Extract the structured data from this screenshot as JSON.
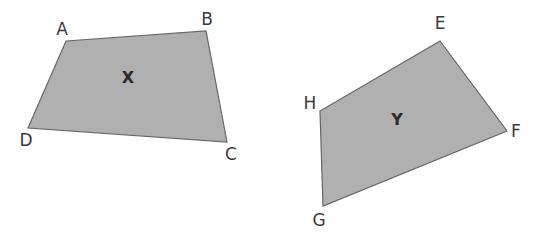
{
  "diagram": {
    "colors": {
      "background": "#ffffff",
      "fill": "#b0b0b0",
      "stroke": "#666666",
      "text": "#3a3a3a"
    },
    "shapes": [
      {
        "name": "X",
        "label": "X",
        "label_pos": [
          128,
          83
        ],
        "vertices": [
          {
            "name": "A",
            "label": "A",
            "point": [
              66,
              41
            ],
            "label_pos": [
              62,
              35
            ]
          },
          {
            "name": "B",
            "label": "B",
            "point": [
              206,
              31
            ],
            "label_pos": [
              207,
              25
            ]
          },
          {
            "name": "C",
            "label": "C",
            "point": [
              227,
              142
            ],
            "label_pos": [
              231,
              160
            ]
          },
          {
            "name": "D",
            "label": "D",
            "point": [
              28,
              128
            ],
            "label_pos": [
              26,
              146
            ]
          }
        ]
      },
      {
        "name": "Y",
        "label": "Y",
        "label_pos": [
          397,
          125
        ],
        "vertices": [
          {
            "name": "E",
            "label": "E",
            "point": [
              440,
              41
            ],
            "label_pos": [
              440,
              29
            ]
          },
          {
            "name": "F",
            "label": "F",
            "point": [
              507,
              131
            ],
            "label_pos": [
              516,
              137
            ]
          },
          {
            "name": "G",
            "label": "G",
            "point": [
              323,
              206
            ],
            "label_pos": [
              319,
              226
            ]
          },
          {
            "name": "H",
            "label": "H",
            "point": [
              320,
              111
            ],
            "label_pos": [
              310,
              109
            ]
          }
        ]
      }
    ]
  }
}
